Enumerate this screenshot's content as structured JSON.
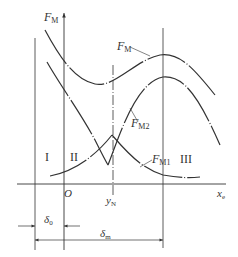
{
  "diagram": {
    "colors": {
      "line": "#333333",
      "background": "#ffffff"
    },
    "y_axis_label": "F",
    "y_axis_label_sub": "M",
    "x_axis_label": "x",
    "x_axis_label_sub": "e",
    "origin_label": "O",
    "yN_label": "y",
    "yN_sub": "N",
    "curves": [
      {
        "name": "FM",
        "label": "F",
        "sub": "M"
      },
      {
        "name": "FM2",
        "label": "F",
        "sub": "M2"
      },
      {
        "name": "FM1",
        "label": "F",
        "sub": "M1"
      }
    ],
    "regions": [
      "I",
      "II",
      "III"
    ],
    "dimensions": [
      {
        "label": "δ",
        "sub": "0"
      },
      {
        "label": "δ",
        "sub": "m"
      }
    ]
  }
}
